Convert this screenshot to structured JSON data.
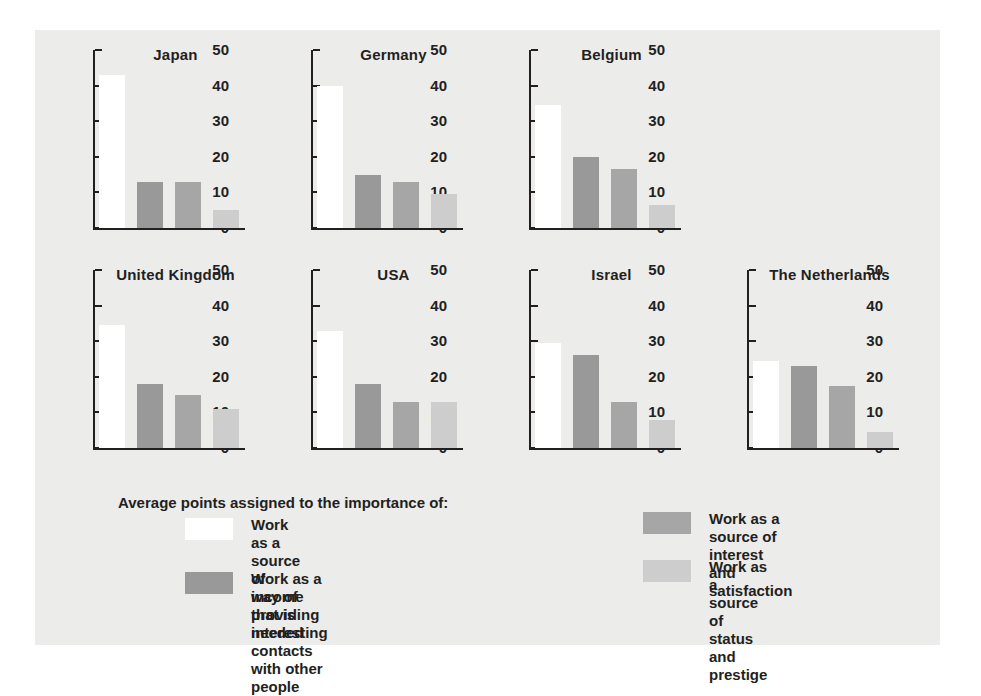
{
  "chart_data": {
    "type": "bar",
    "title": "",
    "xlabel": "",
    "ylabel": "",
    "ylim": [
      0,
      50
    ],
    "yticks": [
      0,
      10,
      20,
      30,
      40,
      50
    ],
    "grid": false,
    "legend_position": "bottom",
    "legend_title": "Average points assigned to the importance of:",
    "series": [
      {
        "name": "Work as a source of income that is needed",
        "color": "#ffffff",
        "values": [
          43,
          40,
          34.5,
          34.5,
          33,
          29.5,
          24.5
        ]
      },
      {
        "name": "Work as a way of providing interesting\ncontacts with other people",
        "color": "#999999",
        "values": [
          13,
          15,
          20,
          18,
          18,
          26,
          23
        ]
      },
      {
        "name": "Work as a source of interest\nand satisfaction",
        "color": "#a6a6a6",
        "values": [
          13,
          13,
          16.5,
          15,
          13,
          13,
          17.5
        ]
      },
      {
        "name": "Work as a source of status\nand prestige",
        "color": "#cdcdcd",
        "values": [
          5,
          9.5,
          6.5,
          11,
          13,
          8,
          4.5
        ]
      }
    ],
    "panels": [
      {
        "title": "Japan",
        "values": [
          43,
          13,
          13,
          5
        ]
      },
      {
        "title": "Germany",
        "values": [
          40,
          15,
          13,
          9.5
        ]
      },
      {
        "title": "Belgium",
        "values": [
          34.5,
          20,
          16.5,
          6.5
        ]
      },
      {
        "title": "United Kingdom",
        "values": [
          34.5,
          18,
          15,
          11
        ]
      },
      {
        "title": "USA",
        "values": [
          33,
          18,
          13,
          13
        ]
      },
      {
        "title": "Israel",
        "values": [
          29.5,
          26,
          13,
          8
        ]
      },
      {
        "title": "The Netherlands",
        "values": [
          24.5,
          23,
          17.5,
          4.5
        ]
      }
    ],
    "colors": {
      "background": "#ececeb",
      "page": "#ffffff",
      "axis": "#231f20",
      "text": "#231f20",
      "series1": "#ffffff",
      "series2": "#999999",
      "series3": "#a6a6a6",
      "series4": "#cdcdcd"
    }
  }
}
